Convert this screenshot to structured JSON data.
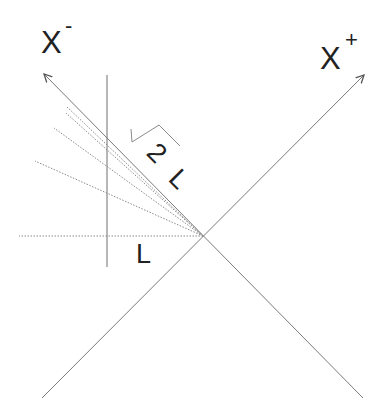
{
  "diagram": {
    "type": "light-cone coordinates diagram",
    "labels": {
      "x_minus": "X",
      "x_minus_sup": "-",
      "x_plus": "X",
      "x_plus_sup": "+",
      "sqrt_two": "2",
      "sqrt_two_L": "L",
      "L": "L"
    },
    "geometry": {
      "origin": [
        203,
        236
      ],
      "x_minus_axis": {
        "start": [
          363,
          398
        ],
        "end_arrow": [
          43,
          73
        ]
      },
      "x_plus_axis": {
        "start": [
          42,
          398
        ],
        "end_arrow": [
          365,
          74
        ]
      },
      "vertical_line": {
        "x": 107,
        "y_top": 75,
        "y_bottom": 267
      },
      "dotted_rays_from_origin": [
        [
          67,
          107
        ],
        [
          66,
          112
        ],
        [
          54,
          128
        ],
        [
          35,
          161
        ],
        [
          19,
          236
        ]
      ]
    },
    "colors": {
      "background": "#ffffff",
      "lines": "#7a7a7a",
      "text": "#222222"
    }
  }
}
